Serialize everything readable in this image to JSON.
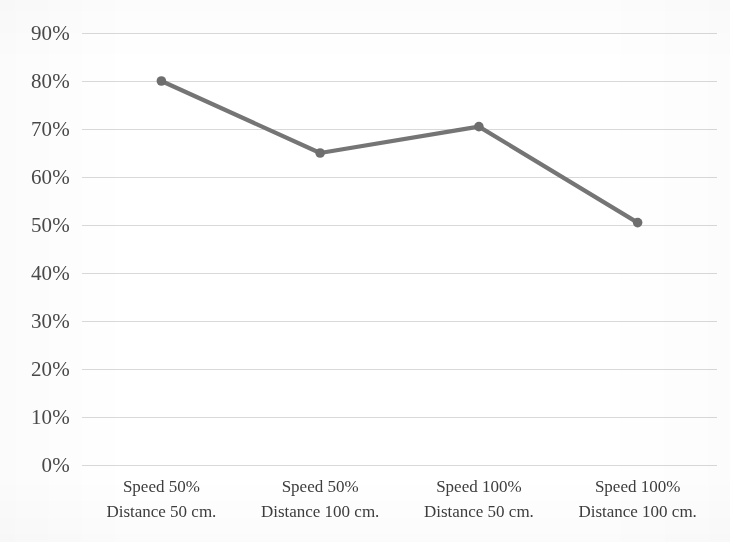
{
  "chart_data": {
    "type": "line",
    "title": "",
    "subtitle": "",
    "xlabel": "",
    "ylabel": "",
    "categories": [
      "Speed 50%\nDistance 50 cm.",
      "Speed 50%\nDistance 100 cm.",
      "Speed 100%\nDistance 50 cm.",
      "Speed 100%\nDistance 100 cm."
    ],
    "category_lines": [
      {
        "line1": "Speed 50%",
        "line2": "Distance 50 cm."
      },
      {
        "line1": "Speed 50%",
        "line2": "Distance 100 cm."
      },
      {
        "line1": "Speed 100%",
        "line2": "Distance 50 cm."
      },
      {
        "line1": "Speed 100%",
        "line2": "Distance 100 cm."
      }
    ],
    "values": [
      80,
      65,
      70.5,
      50.5
    ],
    "value_labels": [
      "80%",
      "65%",
      "70.5%",
      "50.5%"
    ],
    "series": [
      {
        "name": "",
        "values": [
          80,
          65,
          70.5,
          50.5
        ]
      }
    ],
    "ylim": [
      0,
      90
    ],
    "ytick_step": 10,
    "ytick_labels": [
      "0%",
      "10%",
      "20%",
      "30%",
      "40%",
      "50%",
      "60%",
      "70%",
      "80%",
      "90%"
    ],
    "ytick_values": [
      0,
      10,
      20,
      30,
      40,
      50,
      60,
      70,
      80,
      90
    ],
    "grid": true,
    "grid_axis": "y",
    "legend": false,
    "legend_position": "none",
    "markers": true,
    "marker_shape": "circle",
    "colors": {
      "line": "#757575",
      "marker": "#6e6e6e",
      "gridline": "#d9d9d9",
      "axis_text": "#4a4a4a",
      "category_text": "#3d3d3d",
      "background": "#ffffff"
    }
  }
}
